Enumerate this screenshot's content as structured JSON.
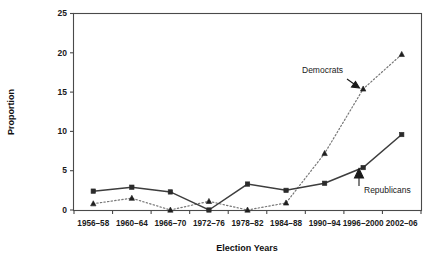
{
  "chart_data": {
    "type": "line",
    "title": "",
    "xlabel": "Election Years",
    "ylabel": "Proportion",
    "categories": [
      "1956–58",
      "1960–64",
      "1966–70",
      "1972–76",
      "1978–82",
      "1984–88",
      "1990–94",
      "1996–2000",
      "2002–06"
    ],
    "series": [
      {
        "name": "Republicans",
        "marker": "square",
        "linestyle": "solid",
        "color": "#2b2b2b",
        "values": [
          2.4,
          2.9,
          2.3,
          0.0,
          3.3,
          2.5,
          3.4,
          5.4,
          9.6
        ]
      },
      {
        "name": "Democrats",
        "marker": "triangle",
        "linestyle": "dotted",
        "color": "#1f1f1f",
        "values": [
          0.8,
          1.5,
          0.0,
          1.1,
          0.0,
          0.9,
          7.2,
          15.4,
          19.8
        ]
      }
    ],
    "ylim": [
      0,
      25
    ],
    "yticks": [
      0,
      5,
      10,
      15,
      20,
      25
    ],
    "ytick_labels": [
      "0",
      "5",
      "10",
      "15",
      "20",
      "25"
    ],
    "grid": false,
    "legend": "none",
    "annotations": [
      {
        "text": "Democrats",
        "target_category": "1996–2000",
        "target_series": "Democrats"
      },
      {
        "text": "Republicans",
        "target_category": "1996–2000",
        "target_series": "Republicans"
      }
    ]
  },
  "figure": {
    "background": "#ffffff",
    "axis_color": "#4a4a4a"
  }
}
